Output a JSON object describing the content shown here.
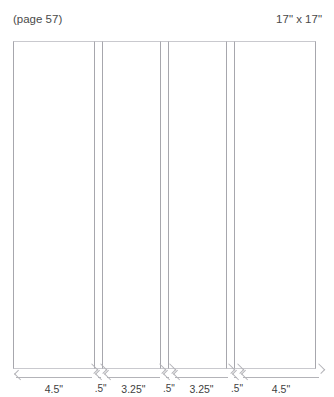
{
  "header": {
    "title": "HERRINGBONE STITCH",
    "page_ref": "(page 57)",
    "size_label": "17\" x 17\""
  },
  "diagram": {
    "name": "panel-layout-diagram",
    "total_width_in": 17,
    "total_height_in": 17,
    "panels": [
      {
        "label": "4.5\"",
        "width_in": 4.5,
        "narrow": false
      },
      {
        "label": ".5\"",
        "width_in": 0.5,
        "narrow": true
      },
      {
        "label": "3.25\"",
        "width_in": 3.25,
        "narrow": false
      },
      {
        "label": ".5\"",
        "width_in": 0.5,
        "narrow": true
      },
      {
        "label": "3.25\"",
        "width_in": 3.25,
        "narrow": false
      },
      {
        "label": ".5\"",
        "width_in": 0.5,
        "narrow": true
      },
      {
        "label": "4.5\"",
        "width_in": 4.5,
        "narrow": false
      }
    ]
  },
  "colors": {
    "panel_border": "#a7a7ad",
    "panel_fill": "#ffffff",
    "dimension_line": "#b3b3b8",
    "title_text": "#9a9aa0",
    "body_text": "#3f3f3f"
  }
}
